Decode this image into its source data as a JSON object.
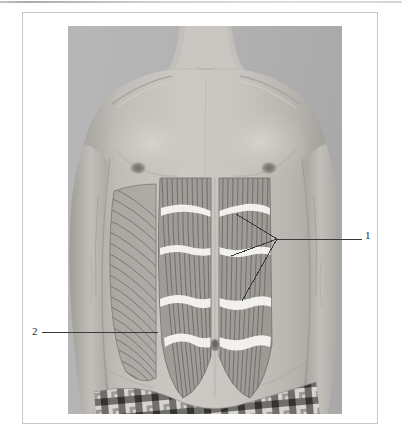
{
  "page": {
    "background_color": "#ffffff",
    "frame": {
      "border_color": "#c8c8c8",
      "x": 22,
      "y": 12,
      "width": 356,
      "height": 412
    },
    "top_rule_color": "#b4b4b4"
  },
  "figure": {
    "kind": "anatomy-photograph",
    "photo": {
      "x": 68,
      "y": 26,
      "width": 274,
      "height": 388
    },
    "subject": {
      "skin_tone": "#b9b6b1",
      "features": [
        "neck",
        "clavicles",
        "shoulders",
        "chest",
        "nipples",
        "navel",
        "arms",
        "plaid-boxer-waistband"
      ]
    },
    "overlay": {
      "muscle_fill": "#8e8e8e",
      "striation_color": "#6d6d6d",
      "tendinous_intersection_color": "#f4f4f2",
      "linea_alba_color": "#c4c2be",
      "muscles": [
        {
          "name": "rectus-abdominis",
          "side": "both",
          "tendinous_intersections": 4
        },
        {
          "name": "external-oblique",
          "side": "subject-right"
        }
      ]
    },
    "callouts": [
      {
        "id": "callout-1",
        "label": "1",
        "label_x": 368,
        "label_y": 236,
        "target_muscle": "rectus abdominis",
        "leader": {
          "type": "multi-branch",
          "vertex_x": 277,
          "vertex_y": 239,
          "branches": [
            {
              "x": 236,
              "y": 214
            },
            {
              "x": 231,
              "y": 256
            },
            {
              "x": 242,
              "y": 301
            }
          ],
          "stem_to_x": 362,
          "stem_to_y": 239
        }
      },
      {
        "id": "callout-2",
        "label": "2",
        "label_x": 35,
        "label_y": 332,
        "target_muscle": "external oblique",
        "leader": {
          "type": "straight",
          "from_x": 42,
          "from_y": 332,
          "to_x": 158,
          "to_y": 332
        }
      }
    ],
    "line_color": "#3a3a3a",
    "label_color": "#2b2b2b"
  }
}
